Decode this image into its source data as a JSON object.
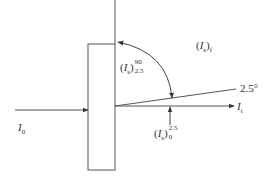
{
  "diagram": {
    "type": "optical-transmission-schematic",
    "colors": {
      "line": "#444444",
      "text": "#333333",
      "background": "#ffffff"
    },
    "labels": {
      "incident": {
        "main": "I",
        "sub": "0"
      },
      "transmitted": {
        "main": "I",
        "sub": "t"
      },
      "scattered_forward": {
        "paren_open": "(",
        "main": "I",
        "sub_inner": "s",
        "paren_close": ")",
        "sub": "f"
      },
      "scattered_wide": {
        "paren_open": "(",
        "main": "I",
        "sub_inner": "s",
        "paren_close": ")",
        "sup": "90",
        "sub": "2.5"
      },
      "scattered_narrow": {
        "paren_open": "(",
        "main": "I",
        "sub_inner": "s",
        "paren_close": ")",
        "sup": "2.5",
        "sub": "0"
      },
      "angle": "2.5°"
    },
    "elements": [
      "incident-beam-arrow",
      "sample-slab",
      "normal-line",
      "transmitted-beam-arrow",
      "angle-line-2.5-deg",
      "curved-angular-range-arrow",
      "narrow-angle-pointer-arrow"
    ]
  }
}
